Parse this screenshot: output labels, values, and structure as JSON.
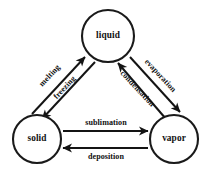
{
  "diagram": {
    "background_color": "#ffffff",
    "stroke_color": "#141414",
    "text_color": "#111111",
    "nodes": [
      {
        "id": "liquid",
        "label": "liquid",
        "cx": 108,
        "cy": 36,
        "r": 26
      },
      {
        "id": "solid",
        "label": "solid",
        "cx": 37,
        "cy": 139,
        "r": 24
      },
      {
        "id": "vapor",
        "label": "vapor",
        "cx": 174,
        "cy": 139,
        "r": 24
      }
    ],
    "edges": [
      {
        "id": "melting",
        "label": "melting",
        "from": "solid",
        "to": "liquid",
        "x1": 32,
        "y1": 114,
        "x2": 85,
        "y2": 57,
        "label_x": 50,
        "label_y": 76,
        "label_rotate": -47
      },
      {
        "id": "freezing",
        "label": "freezing",
        "from": "liquid",
        "to": "solid",
        "x1": 95,
        "y1": 62,
        "x2": 42,
        "y2": 119,
        "label_x": 65,
        "label_y": 88,
        "label_rotate": -47
      },
      {
        "id": "evaporation",
        "label": "evaporation",
        "from": "liquid",
        "to": "vapor",
        "x1": 130,
        "y1": 57,
        "x2": 180,
        "y2": 112,
        "label_x": 160,
        "label_y": 76,
        "label_rotate": 47
      },
      {
        "id": "condensation",
        "label": "condensation",
        "from": "vapor",
        "to": "liquid",
        "x1": 166,
        "y1": 119,
        "x2": 118,
        "y2": 63,
        "label_x": 137,
        "label_y": 89,
        "label_rotate": 47
      },
      {
        "id": "sublimation",
        "label": "sublimation",
        "from": "solid",
        "to": "vapor",
        "x1": 63,
        "y1": 131,
        "x2": 148,
        "y2": 131,
        "label_x": 106,
        "label_y": 123,
        "label_rotate": 0
      },
      {
        "id": "deposition",
        "label": "deposition",
        "from": "vapor",
        "to": "solid",
        "x1": 148,
        "y1": 148,
        "x2": 63,
        "y2": 148,
        "label_x": 106,
        "label_y": 157,
        "label_rotate": 0
      }
    ]
  }
}
